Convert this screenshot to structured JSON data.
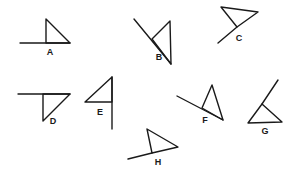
{
  "diagram": {
    "stroke_color": "#1a1a1a",
    "background": "#ffffff",
    "figures": [
      {
        "label": "A",
        "label_pos": [
          50,
          55
        ],
        "triangle": [
          [
            46,
            19
          ],
          [
            46,
            43
          ],
          [
            70,
            43
          ]
        ],
        "tail": [
          [
            20,
            43
          ],
          [
            70,
            43
          ]
        ]
      },
      {
        "label": "B",
        "label_pos": [
          159,
          60
        ],
        "triangle": [
          [
            152,
            39
          ],
          [
            170,
            21
          ],
          [
            171,
            64
          ]
        ],
        "tail": [
          [
            134,
            19
          ],
          [
            171,
            64
          ]
        ]
      },
      {
        "label": "C",
        "label_pos": [
          239,
          41
        ],
        "triangle": [
          [
            221,
            7
          ],
          [
            258,
            12
          ],
          [
            237,
            27
          ]
        ],
        "tail": [
          [
            237,
            27
          ],
          [
            218,
            43
          ]
        ]
      },
      {
        "label": "D",
        "label_pos": [
          53,
          124
        ],
        "triangle": [
          [
            43,
            94
          ],
          [
            70,
            94
          ],
          [
            43,
            121
          ]
        ],
        "tail": [
          [
            18,
            94
          ],
          [
            70,
            94
          ]
        ]
      },
      {
        "label": "E",
        "label_pos": [
          100,
          115
        ],
        "triangle": [
          [
            112,
            77
          ],
          [
            85,
            102
          ],
          [
            112,
            102
          ]
        ],
        "tail": [
          [
            112,
            77
          ],
          [
            112,
            129
          ]
        ]
      },
      {
        "label": "F",
        "label_pos": [
          205,
          123
        ],
        "triangle": [
          [
            202,
            108
          ],
          [
            212,
            85
          ],
          [
            223,
            120
          ]
        ],
        "tail": [
          [
            177,
            96
          ],
          [
            223,
            120
          ]
        ]
      },
      {
        "label": "G",
        "label_pos": [
          265,
          134
        ],
        "triangle": [
          [
            262,
            104
          ],
          [
            248,
            123
          ],
          [
            282,
            122
          ]
        ],
        "tail": [
          [
            262,
            104
          ],
          [
            278,
            80
          ]
        ]
      },
      {
        "label": "H",
        "label_pos": [
          158,
          165
        ],
        "triangle": [
          [
            147,
            129
          ],
          [
            178,
            147
          ],
          [
            152,
            153
          ]
        ],
        "tail": [
          [
            152,
            153
          ],
          [
            128,
            159
          ]
        ]
      }
    ]
  }
}
